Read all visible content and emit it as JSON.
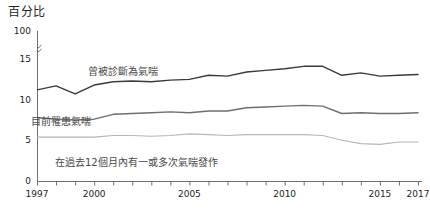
{
  "chart_data": {
    "type": "line",
    "title": "百分比",
    "xlabel": "",
    "ylabel": "",
    "ylim": [
      0,
      16
    ],
    "xlim": [
      1997,
      2017
    ],
    "grid": false,
    "legend_position": "inline-annotations",
    "y_axis_break": {
      "present": true,
      "symbol": "//",
      "below": 15,
      "above": 100
    },
    "y_ticks": [
      "0",
      "5",
      "10",
      "15",
      "100"
    ],
    "y_tick_values": [
      0,
      5,
      10,
      15,
      100
    ],
    "x_ticks": [
      "1997",
      "2000",
      "2005",
      "2010",
      "2015",
      "2017"
    ],
    "x_tick_values": [
      1997,
      2000,
      2005,
      2010,
      2015,
      2017
    ],
    "x_minor_ticks_every": 1,
    "x": [
      1997,
      1998,
      1999,
      2000,
      2001,
      2002,
      2003,
      2004,
      2005,
      2006,
      2007,
      2008,
      2009,
      2010,
      2011,
      2012,
      2013,
      2014,
      2015,
      2016,
      2017
    ],
    "series": [
      {
        "name": "曾被診斷為氣喘",
        "color": "#3a3a3a",
        "values": [
          11.2,
          11.7,
          10.7,
          11.8,
          12.2,
          12.3,
          12.2,
          12.4,
          12.5,
          13.0,
          12.9,
          13.4,
          13.6,
          13.8,
          14.1,
          14.1,
          13.0,
          13.3,
          12.9,
          13.0,
          13.1
        ]
      },
      {
        "name": "目前罹患氣喘",
        "color": "#6e6e6e",
        "values": [
          7.8,
          7.6,
          7.5,
          7.6,
          8.2,
          8.3,
          8.4,
          8.5,
          8.4,
          8.6,
          8.6,
          9.0,
          9.1,
          9.2,
          9.3,
          9.2,
          8.3,
          8.4,
          8.3,
          8.3,
          8.4
        ]
      },
      {
        "name": "在過去12個月內有一或多次氣喘發作",
        "color": "#b6b6b6",
        "values": [
          5.4,
          5.4,
          5.4,
          5.4,
          5.6,
          5.6,
          5.5,
          5.6,
          5.8,
          5.7,
          5.6,
          5.7,
          5.7,
          5.7,
          5.7,
          5.6,
          5.0,
          4.6,
          4.5,
          4.8,
          4.8
        ]
      }
    ]
  },
  "axis": {
    "line_color": "#6e6e6e",
    "tick_color": "#6e6e6e"
  }
}
